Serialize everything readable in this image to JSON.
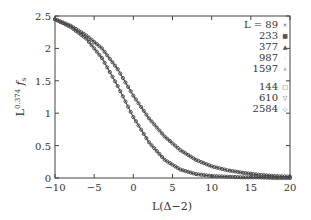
{
  "chart_data": {
    "type": "line",
    "title": "",
    "xlabel": "L(Δ−2)",
    "ylabel": "L^{0.374} f_s",
    "xlim": [
      -10,
      20
    ],
    "ylim": [
      0,
      2.5
    ],
    "xticks": [
      -10,
      -5,
      0,
      5,
      10,
      15,
      20
    ],
    "yticks": [
      0,
      0.5,
      1,
      1.5,
      2,
      2.5
    ],
    "xtick_labels": [
      "−10",
      "−5",
      "0",
      "5",
      "10",
      "15",
      "20"
    ],
    "ytick_labels": [
      "0",
      "0.5",
      "1",
      "1.5",
      "2",
      "2.5"
    ],
    "grid": false,
    "legend_position": "upper right",
    "legend": {
      "group1_prefix": "L =",
      "group1": [
        {
          "label": "89",
          "marker": "×"
        },
        {
          "label": "233",
          "marker": "■"
        },
        {
          "label": "377",
          "marker": "▲"
        },
        {
          "label": "987",
          "marker": "·"
        },
        {
          "label": "1597",
          "marker": "+"
        }
      ],
      "group2": [
        {
          "label": "144",
          "marker": "□"
        },
        {
          "label": "610",
          "marker": "▽"
        },
        {
          "label": "2584",
          "marker": "◇"
        }
      ]
    },
    "x": [
      -10,
      -8,
      -6,
      -4,
      -2,
      0,
      2,
      4,
      6,
      8,
      10,
      12,
      14,
      16,
      18,
      20
    ],
    "series": [
      {
        "name": "L = 89, 233, 377, 987, 1597 (collapsed)",
        "values": [
          2.45,
          2.35,
          2.2,
          2.0,
          1.68,
          1.27,
          0.92,
          0.64,
          0.43,
          0.28,
          0.18,
          0.12,
          0.08,
          0.05,
          0.03,
          0.02
        ]
      },
      {
        "name": "L = 144, 610, 2584 (collapsed)",
        "values": [
          2.45,
          2.33,
          2.15,
          1.85,
          1.42,
          0.94,
          0.55,
          0.28,
          0.13,
          0.06,
          0.03,
          0.02,
          0.01,
          0.01,
          0.0,
          0.0
        ]
      }
    ]
  }
}
